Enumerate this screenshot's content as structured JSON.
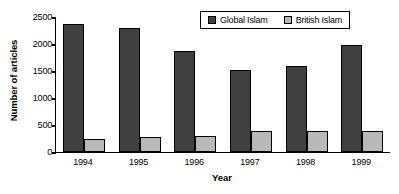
{
  "chart_data": {
    "type": "bar",
    "title": "",
    "xlabel": "Year",
    "ylabel": "Number of articles",
    "categories": [
      "1994",
      "1995",
      "1996",
      "1997",
      "1998",
      "1999"
    ],
    "series": [
      {
        "name": "Global Islam",
        "color": "#404040",
        "values": [
          2370,
          2300,
          1870,
          1520,
          1590,
          1980
        ]
      },
      {
        "name": "British Islam",
        "color": "#b8b8b8",
        "values": [
          240,
          285,
          290,
          380,
          395,
          395
        ]
      }
    ],
    "ylim": [
      0,
      2500
    ],
    "yticks": [
      2500,
      2000,
      1500,
      1000,
      500,
      0
    ],
    "ytick_labels": [
      "2500",
      "2000",
      "1500",
      "1000",
      "500",
      "0"
    ],
    "grid": false,
    "legend_position": "top-right",
    "axis_color": "#000000",
    "background": "#ffffff"
  }
}
